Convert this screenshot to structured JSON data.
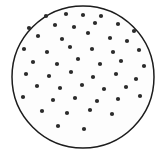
{
  "figure": {
    "type": "scatter-in-circle",
    "caption": "",
    "canvas": {
      "width": 166,
      "height": 158,
      "background": "#ffffff"
    },
    "circle": {
      "name": "boundary-circle",
      "cx": 83,
      "cy": 77,
      "r": 71,
      "stroke_color": "#1c1c1c",
      "stroke_width": 1.5,
      "fill_color": "#fdfdfd"
    },
    "dots": {
      "count": 50,
      "radius": 2.1,
      "color": "#2b2b2b",
      "points": [
        [
          46,
          16
        ],
        [
          66,
          14
        ],
        [
          83,
          15
        ],
        [
          101,
          16
        ],
        [
          29,
          28
        ],
        [
          55,
          25
        ],
        [
          74,
          27
        ],
        [
          95,
          23
        ],
        [
          118,
          24
        ],
        [
          134,
          31
        ],
        [
          38,
          36
        ],
        [
          62,
          39
        ],
        [
          88,
          33
        ],
        [
          110,
          38
        ],
        [
          127,
          41
        ],
        [
          24,
          49
        ],
        [
          47,
          52
        ],
        [
          70,
          47
        ],
        [
          92,
          49
        ],
        [
          113,
          52
        ],
        [
          139,
          50
        ],
        [
          33,
          62
        ],
        [
          57,
          64
        ],
        [
          78,
          59
        ],
        [
          100,
          64
        ],
        [
          121,
          61
        ],
        [
          144,
          66
        ],
        [
          26,
          74
        ],
        [
          49,
          76
        ],
        [
          71,
          72
        ],
        [
          93,
          77
        ],
        [
          116,
          74
        ],
        [
          136,
          79
        ],
        [
          37,
          86
        ],
        [
          60,
          88
        ],
        [
          82,
          85
        ],
        [
          104,
          89
        ],
        [
          126,
          87
        ],
        [
          23,
          97
        ],
        [
          53,
          100
        ],
        [
          75,
          98
        ],
        [
          97,
          101
        ],
        [
          118,
          99
        ],
        [
          140,
          96
        ],
        [
          42,
          111
        ],
        [
          67,
          113
        ],
        [
          90,
          110
        ],
        [
          112,
          114
        ],
        [
          58,
          126
        ],
        [
          84,
          129
        ]
      ]
    }
  }
}
